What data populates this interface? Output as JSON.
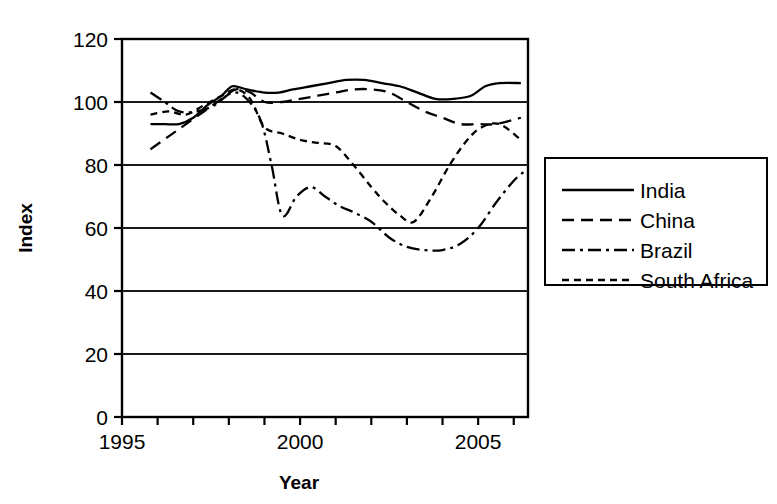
{
  "chart_data": {
    "type": "line",
    "title": "",
    "xlabel": "Year",
    "ylabel": "Index",
    "xlim": [
      1995,
      2006.4
    ],
    "ylim": [
      0,
      120
    ],
    "grid": "horizontal gridlines at 20,40,60,80,100",
    "legend_position": "right, outside plot area, boxed",
    "xticks": [
      1995,
      1996,
      1997,
      1998,
      1999,
      2000,
      2001,
      2002,
      2003,
      2004,
      2005,
      2006
    ],
    "xtick_labels": [
      "1995",
      "",
      "",
      "",
      "",
      "2000",
      "",
      "",
      "",
      "",
      "2005",
      ""
    ],
    "yticks": [
      0,
      20,
      40,
      60,
      80,
      100,
      120
    ],
    "ytick_labels": [
      "0",
      "20",
      "40",
      "60",
      "80",
      "100",
      "120"
    ],
    "series": [
      {
        "name": "India",
        "style": "solid",
        "x": [
          1995.8,
          1996.2,
          1996.6,
          1997.0,
          1997.4,
          1997.8,
          1998.1,
          1998.5,
          1999.0,
          1999.4,
          1999.8,
          2000.3,
          2000.8,
          2001.3,
          2001.8,
          2002.3,
          2002.8,
          2003.3,
          2003.8,
          2004.3,
          2004.8,
          2005.2,
          2005.6,
          2006.2
        ],
        "values": [
          93,
          93,
          93,
          95,
          99,
          102,
          105,
          104,
          103,
          103,
          104,
          105,
          106,
          107,
          107,
          106,
          105,
          103,
          101,
          101,
          102,
          105,
          106,
          106
        ]
      },
      {
        "name": "China",
        "style": "dashed",
        "x": [
          1995.8,
          1996.3,
          1996.8,
          1997.3,
          1997.8,
          1998.2,
          1998.6,
          1999.0,
          1999.5,
          2000.0,
          2000.5,
          2001.0,
          2001.5,
          2002.0,
          2002.5,
          2003.0,
          2003.5,
          2004.0,
          2004.5,
          2005.0,
          2005.5,
          2006.2
        ],
        "values": [
          85,
          89,
          93,
          97,
          101,
          104,
          103,
          100,
          100,
          101,
          102,
          103,
          104,
          104,
          103,
          100,
          97,
          95,
          93,
          93,
          93,
          95
        ]
      },
      {
        "name": "Brazil",
        "style": "dashdot",
        "x": [
          1995.8,
          1996.2,
          1996.6,
          1997.1,
          1997.6,
          1998.1,
          1998.5,
          1998.9,
          1999.2,
          1999.5,
          1999.9,
          2000.3,
          2000.7,
          2001.1,
          2001.5,
          2002.0,
          2002.5,
          2003.0,
          2003.5,
          2004.0,
          2004.5,
          2005.0,
          2005.5,
          2006.0,
          2006.3
        ],
        "values": [
          103,
          100,
          97,
          97,
          99,
          103,
          101,
          94,
          80,
          64,
          70,
          73,
          70,
          67,
          65,
          62,
          57,
          54,
          53,
          53,
          55,
          60,
          68,
          75,
          78
        ]
      },
      {
        "name": "South Africa",
        "style": "dotted",
        "x": [
          1995.8,
          1996.3,
          1996.8,
          1997.3,
          1997.8,
          1998.2,
          1998.6,
          1999.0,
          1999.5,
          2000.0,
          2000.5,
          2001.0,
          2001.5,
          2002.0,
          2002.4,
          2002.8,
          2003.2,
          2003.7,
          2004.2,
          2004.7,
          2005.1,
          2005.6,
          2006.2
        ],
        "values": [
          96,
          97,
          96,
          99,
          102,
          104,
          101,
          92,
          90,
          88,
          87,
          86,
          80,
          73,
          68,
          64,
          62,
          70,
          80,
          88,
          92,
          93,
          88
        ]
      }
    ]
  },
  "legend": {
    "items": [
      {
        "label": "India",
        "style": "solid"
      },
      {
        "label": "China",
        "style": "dashed"
      },
      {
        "label": "Brazil",
        "style": "dashdot"
      },
      {
        "label": "South Africa",
        "style": "dotted"
      }
    ]
  },
  "axes": {
    "x_title": "Year",
    "y_title": "Index"
  }
}
